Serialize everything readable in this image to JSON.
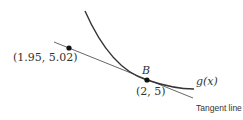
{
  "diagram": {
    "curve": {
      "label": "g(x)",
      "label_func": "g",
      "label_arg": "x",
      "color": "#333333"
    },
    "tangent_line": {
      "label": "Tangent line",
      "color": "#555555"
    },
    "points": [
      {
        "label": "(1.95, 5.02)",
        "x": 1.95,
        "y": 5.02
      },
      {
        "name": "B",
        "label": "(2, 5)",
        "x": 2,
        "y": 5
      }
    ]
  }
}
